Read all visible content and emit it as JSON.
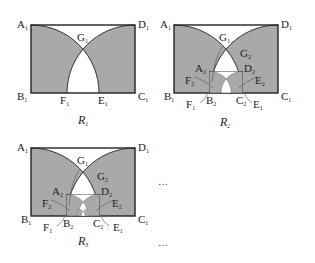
{
  "figure": {
    "fill_color": "#a9a9a9",
    "stroke_color": "#333333",
    "panels": [
      {
        "id": "R1",
        "caption_main": "R",
        "caption_sub": "1",
        "labels": {
          "A1": "A",
          "D1": "D",
          "B1": "B",
          "C1": "C",
          "G1": "G",
          "F1": "F",
          "E1": "E"
        }
      },
      {
        "id": "R2",
        "caption_main": "R",
        "caption_sub": "2",
        "labels": {
          "A1": "A",
          "D1": "D",
          "B1": "B",
          "C1": "C",
          "G1": "G",
          "A2": "A",
          "D2": "D",
          "G2": "G",
          "F2": "F",
          "E2": "E",
          "F1": "F",
          "B2": "B",
          "C2": "C",
          "E1": "E"
        }
      },
      {
        "id": "R3",
        "caption_main": "R",
        "caption_sub": "3",
        "labels": {
          "A1": "A",
          "D1": "D",
          "B1": "B",
          "C1": "C",
          "G1": "G",
          "A2": "A",
          "D2": "D",
          "G2": "G",
          "F2": "F",
          "E2": "E",
          "F1": "F",
          "B2": "B",
          "C2": "C",
          "E1": "E"
        }
      }
    ],
    "ellipsis_1": "…",
    "ellipsis_2": "…"
  }
}
